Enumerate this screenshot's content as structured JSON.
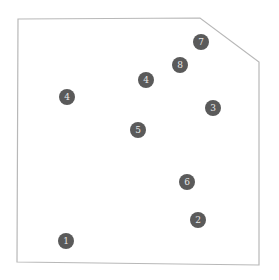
{
  "diagram": {
    "boundary": {
      "points": [
        [
          18,
          19
        ],
        [
          200,
          18
        ],
        [
          259,
          62
        ],
        [
          259,
          265
        ],
        [
          17,
          262
        ]
      ],
      "stroke": "#b8b8b8"
    },
    "marker_color": "#5a5a5a",
    "markers": [
      {
        "label": "1",
        "x": 66,
        "y": 241
      },
      {
        "label": "2",
        "x": 198,
        "y": 220
      },
      {
        "label": "3",
        "x": 213,
        "y": 108
      },
      {
        "label": "4",
        "x": 67,
        "y": 97
      },
      {
        "label": "4",
        "x": 146,
        "y": 80
      },
      {
        "label": "5",
        "x": 138,
        "y": 130
      },
      {
        "label": "6",
        "x": 187,
        "y": 182
      },
      {
        "label": "7",
        "x": 201,
        "y": 42
      },
      {
        "label": "8",
        "x": 180,
        "y": 65
      }
    ]
  }
}
